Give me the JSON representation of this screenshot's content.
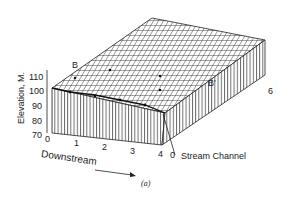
{
  "figure": {
    "caption": "(a)",
    "y_axis": {
      "label": "Elevation, M.",
      "ticks": [
        "110",
        "100",
        "90",
        "80",
        "70"
      ]
    },
    "x_axis": {
      "label": "Downstream",
      "ticks": [
        "0",
        "1",
        "2",
        "3",
        "4"
      ]
    },
    "depth_axis": {
      "ticks": [
        "0",
        "6"
      ]
    },
    "annotations": {
      "section_start": "B",
      "section_end": "B'",
      "stream": "Stream Channel"
    }
  }
}
